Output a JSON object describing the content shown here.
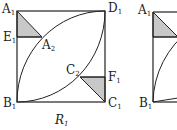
{
  "figure": {
    "left_square": {
      "caption": "R",
      "caption_sub": "1",
      "vertices": {
        "A1": {
          "label": "A",
          "sub": "1"
        },
        "B1": {
          "label": "B",
          "sub": "1"
        },
        "C1": {
          "label": "C",
          "sub": "1"
        },
        "D1": {
          "label": "D",
          "sub": "1"
        },
        "E1": {
          "label": "E",
          "sub": "1"
        },
        "F1": {
          "label": "F",
          "sub": "1"
        },
        "A2": {
          "label": "A",
          "sub": "2"
        },
        "C2": {
          "label": "C",
          "sub": "2"
        }
      }
    },
    "right_square_partial": {
      "vertices": {
        "A1": {
          "label": "A",
          "sub": "1"
        },
        "B1": {
          "label": "B",
          "sub": "1"
        }
      }
    },
    "colors": {
      "line": "#222222",
      "shade": "#c8c8c8"
    }
  }
}
